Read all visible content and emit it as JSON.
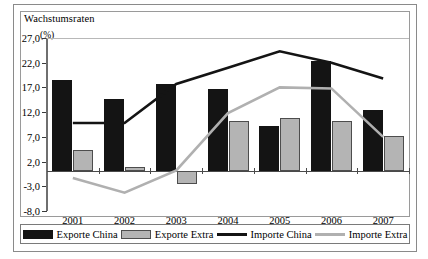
{
  "chart_data": {
    "type": "bar",
    "title": "Wachstumsraten",
    "subtitle": "(%)",
    "xlabel": "",
    "ylabel": "(%)",
    "categories": [
      "2001",
      "2002",
      "2003",
      "2004",
      "2005",
      "2006",
      "2007"
    ],
    "ylim": [
      -8.0,
      27.0
    ],
    "ytick_labels": [
      "27,0",
      "22,0",
      "17,0",
      "12,0",
      "7,0",
      "2,0",
      "-3,0",
      "-8,0"
    ],
    "ytick_values": [
      27.0,
      22.0,
      17.0,
      12.0,
      7.0,
      2.0,
      -3.0,
      -8.0
    ],
    "grid": false,
    "legend_position": "bottom",
    "series": [
      {
        "name": "Exporte China",
        "kind": "bar",
        "color": "#141414",
        "values": [
          18.6,
          14.6,
          17.6,
          16.6,
          9.2,
          22.3,
          12.5
        ]
      },
      {
        "name": "Exporte Extra",
        "kind": "bar",
        "color": "#b4b4b4",
        "values": [
          4.4,
          0.9,
          -2.6,
          10.2,
          10.9,
          10.3,
          7.1
        ]
      },
      {
        "name": "Importe China",
        "kind": "line",
        "color": "#141414",
        "values": [
          9.8,
          9.8,
          17.7,
          21.0,
          24.3,
          22.0,
          18.8
        ]
      },
      {
        "name": "Importe Extra",
        "kind": "line",
        "color": "#b0b0b0",
        "values": [
          -1.3,
          -4.3,
          0.2,
          11.8,
          17.0,
          16.8,
          7.0
        ]
      }
    ]
  },
  "legend": {
    "items": [
      {
        "label": "Exporte China",
        "style": "bar-dark"
      },
      {
        "label": "Exporte Extra",
        "style": "bar-gray"
      },
      {
        "label": "Importe China",
        "style": "line-dark"
      },
      {
        "label": "Importe Extra",
        "style": "line-gray"
      }
    ]
  },
  "colors": {
    "export_china": "#141414",
    "export_extra": "#b4b4b4",
    "import_china": "#141414",
    "import_extra": "#b0b0b0",
    "frame": "#8a8a8a",
    "background": "#ffffff"
  }
}
